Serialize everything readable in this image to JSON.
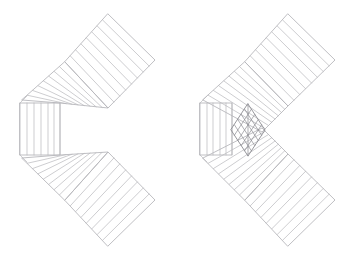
{
  "figure": {
    "background": "#ffffff",
    "stroke_color": "#b8b8bc",
    "stroke_dark": "#8c8c92",
    "panels": [
      {
        "id": "left",
        "label": "Folded strip mesh (with gap at fold)",
        "outline_top_arm": [
          [
            108,
            14
          ],
          [
            155,
            60
          ],
          [
            108,
            108
          ],
          [
            60,
            103
          ],
          [
            20,
            103
          ],
          [
            65,
            60
          ]
        ],
        "outline_bottom_arm": [
          [
            20,
            155
          ],
          [
            60,
            155
          ],
          [
            108,
            152
          ],
          [
            155,
            200
          ],
          [
            108,
            246
          ],
          [
            65,
            200
          ]
        ],
        "corner_column": {
          "x0": 20,
          "x1": 60,
          "y0": 103,
          "y1": 155,
          "divisions": 6
        },
        "stripes": 8
      },
      {
        "id": "right",
        "label": "Folded strip mesh (overlapping at fold)",
        "outline_top_arm": [
          [
            288,
            14
          ],
          [
            335,
            60
          ],
          [
            268,
            128
          ],
          [
            232,
            103
          ],
          [
            200,
            103
          ],
          [
            245,
            60
          ]
        ],
        "outline_bottom_arm": [
          [
            200,
            155
          ],
          [
            232,
            155
          ],
          [
            288,
            200
          ],
          [
            335,
            200
          ],
          [
            288,
            246
          ],
          [
            245,
            200
          ]
        ],
        "corner_column": {
          "x0": 200,
          "x1": 232,
          "y0": 103,
          "y1": 155,
          "divisions": 5
        },
        "overlap_diamond": {
          "cx": 248,
          "cy": 130,
          "rx": 17,
          "ry": 26
        },
        "stripes": 8
      }
    ]
  }
}
